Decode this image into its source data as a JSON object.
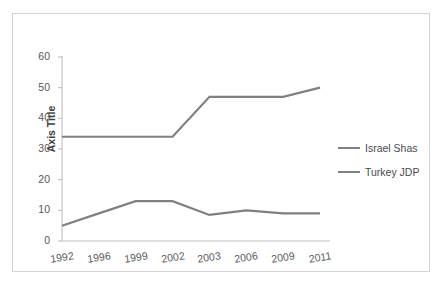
{
  "chart_data": {
    "type": "line",
    "title": "",
    "xlabel": "",
    "ylabel": "Axis Title",
    "categories": [
      "1992",
      "1996",
      "1999",
      "2002",
      "2003",
      "2006",
      "2009",
      "2011"
    ],
    "series": [
      {
        "name": "Israel Shas",
        "color": "#808080",
        "values": [
          34,
          34,
          34,
          34,
          47,
          47,
          47,
          50
        ]
      },
      {
        "name": "Turkey JDP",
        "color": "#808080",
        "values": [
          5,
          9,
          13,
          13,
          8.5,
          10,
          9,
          9
        ]
      }
    ],
    "ylim": [
      0,
      60
    ],
    "yticks": [
      0,
      10,
      20,
      30,
      40,
      50,
      60
    ],
    "ytick_labels": [
      "0",
      "10",
      "20",
      "30",
      "40",
      "50",
      "60"
    ],
    "grid": false,
    "legend_position": "right",
    "annotations": []
  },
  "axes": {
    "y_title": "Axis Title"
  },
  "legend": {
    "entries": [
      {
        "label": "Israel Shas"
      },
      {
        "label": "Turkey JDP"
      }
    ]
  },
  "colors": {
    "line": "#808080",
    "axis": "#bfbfbf",
    "border": "#d4d4d4",
    "tick_text": "#595959",
    "title_text": "#3f3f3f"
  }
}
